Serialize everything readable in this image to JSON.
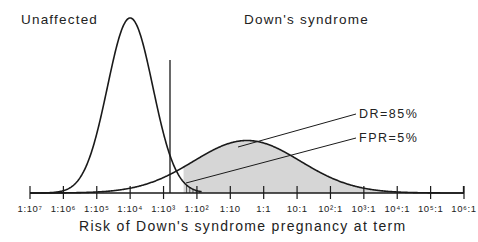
{
  "chart_data": {
    "type": "area",
    "title": "",
    "xlabel": "Risk of Down's syndrome pregnancy at term",
    "ylabel": "",
    "x_scale": "log10 odds",
    "tick_labels": [
      "1:10⁷",
      "1:10⁶",
      "1:10⁵",
      "1:10⁴",
      "1:10³",
      "1:10²",
      "1:10",
      "1:1",
      "10:1",
      "10²:1",
      "10³:1",
      "10⁴:1",
      "10⁵:1",
      "10⁶:1"
    ],
    "tick_log_values": [
      -7,
      -6,
      -5,
      -4,
      -3,
      -2,
      -1,
      0,
      1,
      2,
      3,
      4,
      5,
      6
    ],
    "xlim": [
      -7,
      6
    ],
    "grid": false,
    "legend": "none",
    "series": [
      {
        "name": "Unaffected",
        "distribution": "log-gaussian",
        "mean_log": -4.0,
        "sd_log": 0.68,
        "relative_peak": 1.0,
        "x_range": [
          -7,
          -1.85
        ]
      },
      {
        "name": "Down's syndrome",
        "distribution": "log-gaussian",
        "mean_log": -0.5,
        "sd_log": 1.6,
        "relative_peak": 0.3,
        "x_range": [
          -7,
          6
        ]
      }
    ],
    "cutoff_log": -2.4,
    "shaded_regions": [
      {
        "name": "Detection rate",
        "series": "Down's syndrome",
        "side": "right of cutoff",
        "style": "gray fill",
        "value_percent": 85
      },
      {
        "name": "False positive rate",
        "series": "Unaffected",
        "side": "right of cutoff",
        "style": "vertical hatch",
        "value_percent": 5
      }
    ],
    "annotations": [
      {
        "text": "DR=85%",
        "points_to": "gray area under Down's syndrome curve"
      },
      {
        "text": "FPR=5%",
        "points_to": "hatched area under Unaffected curve"
      }
    ],
    "group_labels": [
      "Unaffected",
      "Down's syndrome"
    ]
  },
  "labels": {
    "unaffected": "Unaffected",
    "downs": "Down's syndrome",
    "dr": "DR=85%",
    "fpr": "FPR=5%",
    "xlabel": "Risk of Down's syndrome pregnancy at term"
  },
  "colors": {
    "line": "#1a1a1a",
    "fill": "#d6d6d6",
    "text": "#222222"
  }
}
